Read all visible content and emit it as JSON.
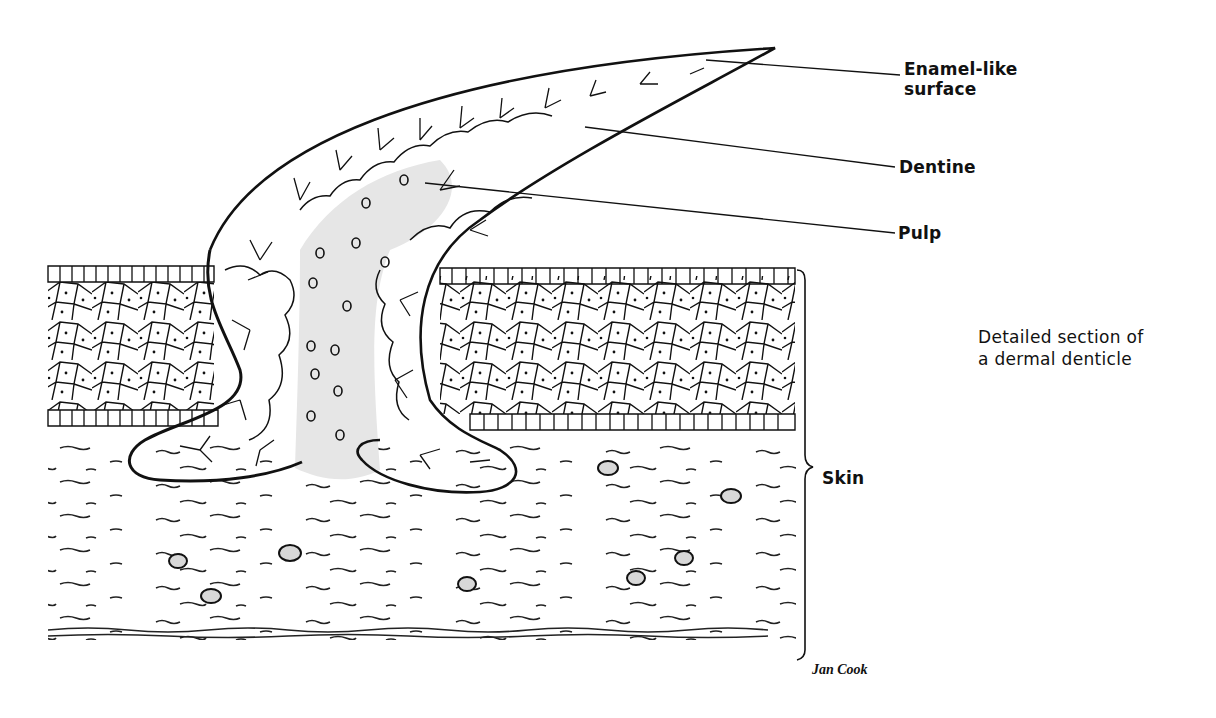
{
  "figure": {
    "caption_line1": "Detailed section of",
    "caption_line2": "a dermal denticle",
    "signature": "Jan Cook"
  },
  "labels": {
    "enamel_line1": "Enamel-like",
    "enamel_line2": "surface",
    "dentine": "Dentine",
    "pulp": "Pulp",
    "skin": "Skin"
  },
  "colors": {
    "ink": "#111111",
    "pulp_fill": "#e6e6e6",
    "cell_fill": "#ffffff",
    "background": "#ffffff"
  }
}
